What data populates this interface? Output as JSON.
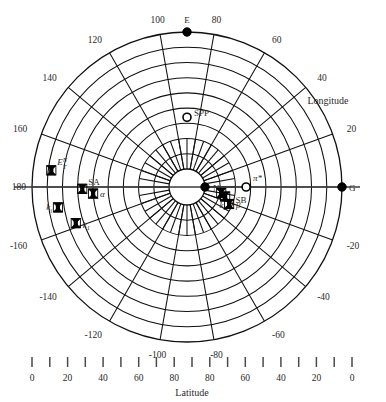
{
  "figure": {
    "type": "polar-scatter",
    "axis_titles": {
      "longitude": "Longitude",
      "latitude": "Latitude"
    }
  },
  "chart_data": {
    "type": "scatter",
    "title": "",
    "subtitle": "",
    "projection": "polar",
    "xlabel": "Latitude",
    "ylabel": "Longitude",
    "radial_axis": {
      "name": "Latitude",
      "center_value": 90,
      "edge_value": 0,
      "rings": 9,
      "ring_step": 10
    },
    "angular_axis": {
      "name": "Longitude",
      "range": [
        -180,
        180
      ],
      "spoke_step": 20,
      "labels": [
        "100",
        "80",
        "120",
        "60",
        "140",
        "40",
        "160",
        "20",
        "180",
        "0",
        "-160",
        "-20",
        "-140",
        "-40",
        "-120",
        "-60",
        "-100",
        "-80"
      ]
    },
    "grid": true,
    "legend": "none",
    "ring_labels": [
      {
        "text": "100",
        "lon": 100
      },
      {
        "text": "80",
        "lon": 80
      },
      {
        "text": "120",
        "lon": 120
      },
      {
        "text": "60",
        "lon": 60
      },
      {
        "text": "140",
        "lon": 140
      },
      {
        "text": "40",
        "lon": 40
      },
      {
        "text": "160",
        "lon": 160
      },
      {
        "text": "20",
        "lon": 20
      },
      {
        "text": "180",
        "lon": 180
      },
      {
        "text": "-160",
        "lon": -160
      },
      {
        "text": "-20",
        "lon": -20
      },
      {
        "text": "-140",
        "lon": -140
      },
      {
        "text": "-40",
        "lon": -40
      },
      {
        "text": "-120",
        "lon": -120
      },
      {
        "text": "-60",
        "lon": -60
      },
      {
        "text": "-100",
        "lon": -100
      },
      {
        "text": "-80",
        "lon": -80
      }
    ],
    "points": [
      {
        "id": "E",
        "label": "E",
        "marker": "filled-circle",
        "lon": 90,
        "lat": 0
      },
      {
        "id": "G",
        "label": "G",
        "marker": "filled-circle",
        "lon": 0,
        "lat": 0
      },
      {
        "id": "N",
        "label": "N",
        "marker": "filled-circle",
        "lon": 0,
        "lat": 90
      },
      {
        "id": "SPP",
        "label": "SPP",
        "marker": "open-circle",
        "lon": 90,
        "lat": 56
      },
      {
        "id": "pi*",
        "label": "π*",
        "marker": "open-circle",
        "lon": 0,
        "lat": 63
      },
      {
        "id": "ETN",
        "label": "E",
        "label_sup": "N",
        "label_sub": "T",
        "marker": "x-square",
        "lon": 173,
        "lat": 12
      },
      {
        "id": "SA",
        "label": "SA",
        "marker": "none",
        "lon": 180,
        "lat": 33
      },
      {
        "id": "SB",
        "label": "SB",
        "marker": "none",
        "lon": -12,
        "lat": 72
      },
      {
        "id": "alpha",
        "label": "α",
        "marker": "x-square",
        "lon": -176,
        "lat": 40
      },
      {
        "id": "ki",
        "label": "k",
        "label_sub": "i",
        "marker": "x-square",
        "lon": -171,
        "lat": 16
      },
      {
        "id": "k1",
        "label": "k",
        "label_sub": "1",
        "marker": "x-square",
        "lon": -162,
        "lat": 25
      },
      {
        "id": "k2",
        "label": "k",
        "label_sub": "2",
        "marker": "x-square",
        "lon": -14,
        "lat": 76
      },
      {
        "id": "beta",
        "label": "β",
        "marker": "x-square",
        "lon": -22,
        "lat": 72
      },
      {
        "id": "unl1",
        "label": "",
        "marker": "x-square",
        "lon": -179,
        "lat": 33
      },
      {
        "id": "unl2",
        "label": "",
        "marker": "x-square",
        "lon": -10,
        "lat": 79
      }
    ],
    "bottom_axis": {
      "label": "Latitude",
      "tick_values": [
        0,
        10,
        20,
        30,
        40,
        50,
        60,
        70,
        80,
        90,
        80,
        70,
        60,
        50,
        40,
        30,
        20,
        10,
        0
      ],
      "tick_labels": [
        "0",
        "",
        "20",
        "",
        "40",
        "",
        "60",
        "",
        "80",
        "",
        "80",
        "",
        "60",
        "",
        "40",
        "",
        "20",
        "",
        "0"
      ]
    }
  }
}
